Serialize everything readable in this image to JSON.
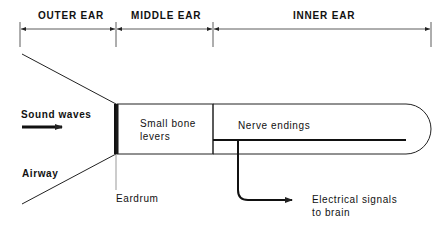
{
  "diagram": {
    "type": "ear-sound-conduction-schematic",
    "sections": [
      {
        "label": "OUTER EAR",
        "x_start": 20,
        "x_end": 116
      },
      {
        "label": "MIDDLE EAR",
        "x_start": 116,
        "x_end": 213
      },
      {
        "label": "INNER EAR",
        "x_start": 213,
        "x_end": 431
      }
    ],
    "labels": {
      "sound_waves": "Sound waves",
      "airway": "Airway",
      "eardrum": "Eardrum",
      "small_bone_levers_line1": "Small bone",
      "small_bone_levers_line2": "levers",
      "nerve_endings": "Nerve endings",
      "electrical_signals_line1": "Electrical signals",
      "electrical_signals_line2": "to brain"
    },
    "colors": {
      "line": "#222222",
      "background": "#ffffff"
    }
  }
}
